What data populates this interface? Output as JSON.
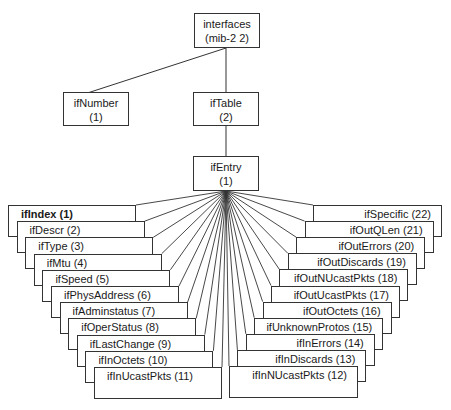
{
  "root": {
    "name": "interfaces",
    "oid": "(mib-2 2)"
  },
  "level1": [
    {
      "name": "ifNumber",
      "oid": "(1)"
    },
    {
      "name": "ifTable",
      "oid": "(2)"
    }
  ],
  "entry": {
    "name": "ifEntry",
    "oid": "(1)"
  },
  "left_column": [
    {
      "label": "ifIndex (1)",
      "bold": true
    },
    {
      "label": "ifDescr  (2)"
    },
    {
      "label": "ifType (3)"
    },
    {
      "label": "ifMtu (4)"
    },
    {
      "label": "ifSpeed (5)"
    },
    {
      "label": "ifPhysAddress (6)"
    },
    {
      "label": "ifAdminstatus (7)"
    },
    {
      "label": "ifOperStatus (8)"
    },
    {
      "label": "ifLastChange (9)"
    },
    {
      "label": "ifInOctets (10)"
    },
    {
      "label": "ifInUcastPkts (11)"
    }
  ],
  "right_column": [
    {
      "label": "ifSpecific (22)"
    },
    {
      "label": "ifOutQLen  (21)"
    },
    {
      "label": "ifOutErrors (20)"
    },
    {
      "label": "ifOutDiscards (19)"
    },
    {
      "label": "ifOutNUcastPkts (18)"
    },
    {
      "label": "ifOutUcastPkts (17)"
    },
    {
      "label": "ifOutOctets (16)"
    },
    {
      "label": "ifUnknownProtos (15)"
    },
    {
      "label": "ifInErrors (14)"
    },
    {
      "label": "ifInDiscards (13)"
    },
    {
      "label": "ifInNUcastPkts (12)"
    }
  ]
}
